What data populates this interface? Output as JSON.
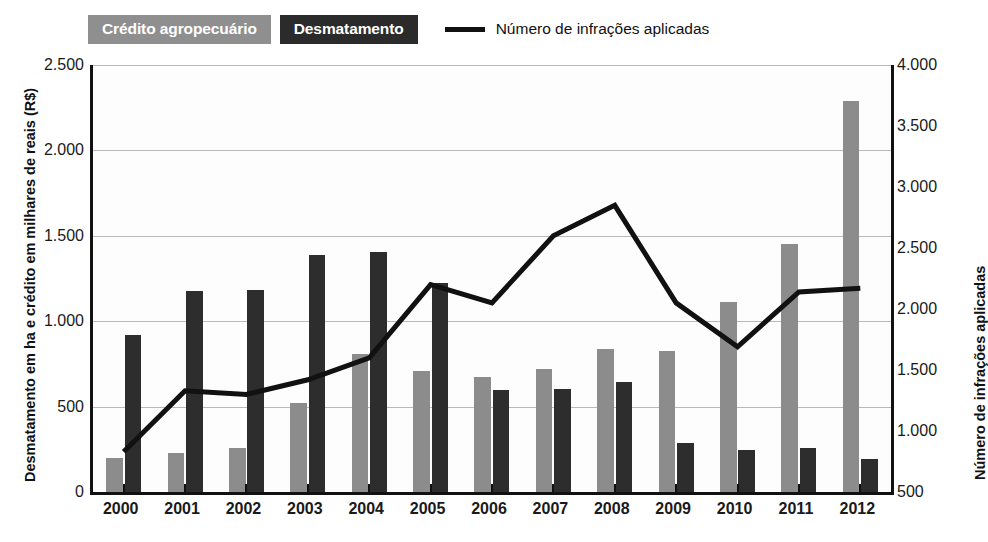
{
  "legend": {
    "items": [
      {
        "label": "Crédito agropecuário",
        "type": "swatch",
        "color": "#8f8f8f",
        "name": "legend-credito"
      },
      {
        "label": "Desmatamento",
        "type": "swatch",
        "color": "#2b2b2b",
        "name": "legend-desmatamento"
      },
      {
        "label": "Número de infrações aplicadas",
        "type": "line",
        "color": "#111111",
        "name": "legend-infracoes"
      }
    ]
  },
  "axes": {
    "left_title": "Desmatamento em ha e crédito em milhares de reais (R$)",
    "right_title": "Número de infrações aplicadas",
    "left_ticks": [
      "2.500",
      "2.000",
      "1.500",
      "1.000",
      "500",
      "0"
    ],
    "left_tick_values": [
      2500,
      2000,
      1500,
      1000,
      500,
      0
    ],
    "right_ticks": [
      "4.000",
      "3.500",
      "3.000",
      "2.500",
      "2.000",
      "1.500",
      "1.000",
      "500"
    ],
    "right_tick_values": [
      4000,
      3500,
      3000,
      2500,
      2000,
      1500,
      1000,
      500
    ]
  },
  "chart_data": {
    "type": "bar",
    "title": "",
    "xlabel": "",
    "ylabel": "Desmatamento em ha e crédito em milhares de reais (R$)",
    "y2label": "Número de infrações aplicadas",
    "ylim": [
      0,
      2500
    ],
    "y2lim": [
      500,
      4000
    ],
    "grid": true,
    "legend_position": "top-left",
    "categories": [
      "2000",
      "2001",
      "2002",
      "2003",
      "2004",
      "2005",
      "2006",
      "2007",
      "2008",
      "2009",
      "2010",
      "2011",
      "2012"
    ],
    "series": [
      {
        "name": "Crédito agropecuário",
        "type": "bar",
        "axis": "left",
        "color": "#8c8c8c",
        "values": [
          200,
          230,
          255,
          520,
          810,
          710,
          675,
          720,
          840,
          825,
          1110,
          1450,
          2290
        ]
      },
      {
        "name": "Desmatamento",
        "type": "bar",
        "axis": "left",
        "color": "#2d2d2d",
        "values": [
          920,
          1175,
          1185,
          1385,
          1405,
          1225,
          595,
          605,
          645,
          285,
          245,
          255,
          195
        ]
      },
      {
        "name": "Número de infrações aplicadas",
        "type": "line",
        "axis": "right",
        "color": "#111111",
        "values": [
          830,
          1330,
          1300,
          1420,
          1600,
          2200,
          2050,
          2600,
          2850,
          2050,
          1690,
          2140,
          2170
        ]
      }
    ]
  }
}
